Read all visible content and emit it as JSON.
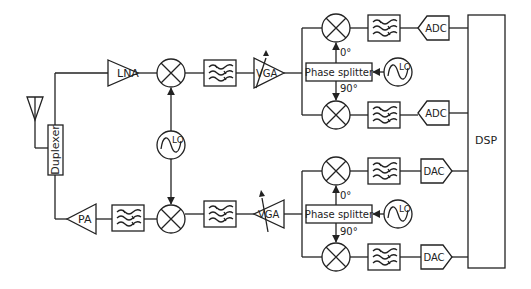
{
  "diagram": {
    "title": "",
    "colors": {
      "stroke": "#222222",
      "background": "#ffffff"
    },
    "blocks": {
      "antenna": {
        "icon": "antenna-icon"
      },
      "duplexer": {
        "label": "Duplexer"
      },
      "lna": {
        "label": "LNA"
      },
      "pa": {
        "label": "PA"
      },
      "lo_main": {
        "label": "LO"
      },
      "rx_vga": {
        "label": "VGA"
      },
      "tx_vga": {
        "label": "VGA"
      },
      "rx_phase_splitter": {
        "label": "Phase splitter"
      },
      "tx_phase_splitter": {
        "label": "Phase splitter"
      },
      "rx_lo": {
        "label": "LO"
      },
      "tx_lo": {
        "label": "LO"
      },
      "rx_angle_0": {
        "label": "0°"
      },
      "rx_angle_90": {
        "label": "90°"
      },
      "tx_angle_0": {
        "label": "0°"
      },
      "tx_angle_90": {
        "label": "90°"
      },
      "adc_i": {
        "label": "ADC"
      },
      "adc_q": {
        "label": "ADC"
      },
      "dac_i": {
        "label": "DAC"
      },
      "dac_q": {
        "label": "DAC"
      },
      "dsp": {
        "label": "DSP"
      }
    },
    "nodes": [
      "Antenna",
      "Duplexer",
      "LNA",
      "Mixer",
      "Filter",
      "VGA",
      "Phase splitter",
      "LO",
      "ADC",
      "DAC",
      "DSP",
      "PA"
    ],
    "edges": [
      [
        "Antenna",
        "Duplexer"
      ],
      [
        "Duplexer",
        "LNA"
      ],
      [
        "LNA",
        "RX Mixer"
      ],
      [
        "LO",
        "RX Mixer"
      ],
      [
        "RX Mixer",
        "RX Filter"
      ],
      [
        "RX Filter",
        "RX VGA"
      ],
      [
        "RX VGA",
        "RX I Mixer"
      ],
      [
        "RX VGA",
        "RX Q Mixer"
      ],
      [
        "RX LO",
        "RX Phase splitter"
      ],
      [
        "RX Phase splitter",
        "RX I Mixer (0°)"
      ],
      [
        "RX Phase splitter",
        "RX Q Mixer (90°)"
      ],
      [
        "RX I Mixer",
        "I Filter"
      ],
      [
        "I Filter",
        "ADC"
      ],
      [
        "RX Q Mixer",
        "Q Filter"
      ],
      [
        "Q Filter",
        "ADC"
      ],
      [
        "ADC",
        "DSP"
      ],
      [
        "DSP",
        "DAC"
      ],
      [
        "DAC",
        "TX Filter"
      ],
      [
        "TX Filter",
        "TX Mixer"
      ],
      [
        "TX Mixer",
        "TX VGA"
      ],
      [
        "TX VGA",
        "TX Filter"
      ],
      [
        "TX Filter",
        "TX Mixer (upconvert)"
      ],
      [
        "LO",
        "TX Mixer (upconvert)"
      ],
      [
        "TX Mixer (upconvert)",
        "PA Filter"
      ],
      [
        "PA Filter",
        "PA"
      ],
      [
        "PA",
        "Duplexer"
      ]
    ]
  }
}
